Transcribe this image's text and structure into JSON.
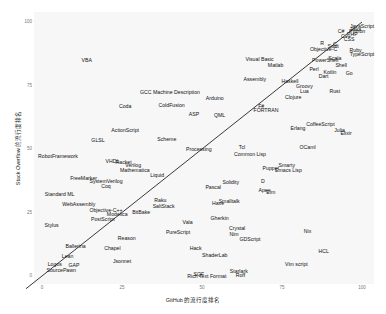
{
  "chart_data": {
    "type": "scatter",
    "title": "",
    "xlabel": "GitHub 的流行度排名",
    "ylabel": "Stack Overflow 的流行度排名",
    "xlim": [
      0,
      100
    ],
    "ylim": [
      0,
      100
    ],
    "xticks": [
      "0",
      "25",
      "50",
      "75",
      "100"
    ],
    "yticks": [
      "0",
      "25",
      "50",
      "75",
      "100"
    ],
    "grid": false,
    "trend_line": {
      "x": [
        -5,
        100
      ],
      "y": [
        -5,
        100
      ]
    },
    "points": [
      {
        "label": "JavaScript",
        "x": 100,
        "y": 98
      },
      {
        "label": "Java",
        "x": 98,
        "y": 97
      },
      {
        "label": "Python",
        "x": 98.5,
        "y": 96
      },
      {
        "label": "PHP",
        "x": 97,
        "y": 95
      },
      {
        "label": "C#",
        "x": 93.5,
        "y": 96
      },
      {
        "label": "C++",
        "x": 95,
        "y": 94
      },
      {
        "label": "CSS",
        "x": 96,
        "y": 93
      },
      {
        "label": "C",
        "x": 91.5,
        "y": 91
      },
      {
        "label": "R",
        "x": 87.5,
        "y": 91.5
      },
      {
        "label": "Objective-C",
        "x": 88,
        "y": 89
      },
      {
        "label": "Swift",
        "x": 91,
        "y": 90
      },
      {
        "label": "Ruby",
        "x": 98,
        "y": 88.5
      },
      {
        "label": "TypeScript",
        "x": 100,
        "y": 87
      },
      {
        "label": "PowerShell",
        "x": 88.5,
        "y": 84.5
      },
      {
        "label": "Scala",
        "x": 91.5,
        "y": 85.5
      },
      {
        "label": "Shell",
        "x": 93.5,
        "y": 82.5
      },
      {
        "label": "Perl",
        "x": 85,
        "y": 81
      },
      {
        "label": "Kotlin",
        "x": 90,
        "y": 80
      },
      {
        "label": "Dart",
        "x": 88,
        "y": 78.5
      },
      {
        "label": "Go",
        "x": 96,
        "y": 79.5
      },
      {
        "label": "Visual Basic",
        "x": 68,
        "y": 85
      },
      {
        "label": "Matlab",
        "x": 73,
        "y": 82.5
      },
      {
        "label": "Haskell",
        "x": 77.5,
        "y": 76.5
      },
      {
        "label": "Assembly",
        "x": 66.5,
        "y": 77
      },
      {
        "label": "Groovy",
        "x": 82,
        "y": 74.5
      },
      {
        "label": "Lua",
        "x": 82,
        "y": 72.5
      },
      {
        "label": "Rust",
        "x": 91.5,
        "y": 72.5
      },
      {
        "label": "Clojure",
        "x": 78.5,
        "y": 70
      },
      {
        "label": "F#",
        "x": 68.5,
        "y": 66.5
      },
      {
        "label": "FORTRAN",
        "x": 70,
        "y": 65
      },
      {
        "label": "CoffeeScript",
        "x": 87,
        "y": 59.5
      },
      {
        "label": "Erlang",
        "x": 80,
        "y": 58
      },
      {
        "label": "Julia",
        "x": 93,
        "y": 57
      },
      {
        "label": "Elixir",
        "x": 95,
        "y": 56
      },
      {
        "label": "OCaml",
        "x": 83,
        "y": 50.5
      },
      {
        "label": "VBA",
        "x": 14,
        "y": 84.5
      },
      {
        "label": "GCC Machine Description",
        "x": 40,
        "y": 72
      },
      {
        "label": "Arduino",
        "x": 54,
        "y": 69.5
      },
      {
        "label": "Coda",
        "x": 26,
        "y": 66.5
      },
      {
        "label": "ColdFusion",
        "x": 40.5,
        "y": 67
      },
      {
        "label": "ASP",
        "x": 47.5,
        "y": 63.5
      },
      {
        "label": "QML",
        "x": 55.5,
        "y": 63
      },
      {
        "label": "ActionScript",
        "x": 26,
        "y": 57
      },
      {
        "label": "Scheme",
        "x": 39,
        "y": 53.5
      },
      {
        "label": "GLSL",
        "x": 17.5,
        "y": 53
      },
      {
        "label": "Tcl",
        "x": 62.5,
        "y": 50.5
      },
      {
        "label": "Common Lisp",
        "x": 65,
        "y": 47.5
      },
      {
        "label": "Processing",
        "x": 49,
        "y": 49.5
      },
      {
        "label": "RobotFramework",
        "x": 5,
        "y": 47
      },
      {
        "label": "VHDL",
        "x": 22,
        "y": 45
      },
      {
        "label": "Racket",
        "x": 25.5,
        "y": 44.5
      },
      {
        "label": "Verilog",
        "x": 28.5,
        "y": 43.5
      },
      {
        "label": "Mathematica",
        "x": 29,
        "y": 41.5
      },
      {
        "label": "Liquid",
        "x": 36,
        "y": 39.5
      },
      {
        "label": "FreeMarker",
        "x": 13,
        "y": 38
      },
      {
        "label": "SystemVerilog",
        "x": 20,
        "y": 37
      },
      {
        "label": "Coq",
        "x": 20,
        "y": 35
      },
      {
        "label": "Standard ML",
        "x": 5.5,
        "y": 32
      },
      {
        "label": "WebAssembly",
        "x": 11.5,
        "y": 28
      },
      {
        "label": "Smarty",
        "x": 76.5,
        "y": 43.5
      },
      {
        "label": "Puppet",
        "x": 71.5,
        "y": 42
      },
      {
        "label": "Emacs Lisp",
        "x": 77,
        "y": 41.5
      },
      {
        "label": "D",
        "x": 69,
        "y": 37
      },
      {
        "label": "Solidity",
        "x": 59,
        "y": 36.5
      },
      {
        "label": "Pascal",
        "x": 53.5,
        "y": 34.5
      },
      {
        "label": "Apex",
        "x": 69.5,
        "y": 33.5
      },
      {
        "label": "Elm",
        "x": 71.5,
        "y": 32.5
      },
      {
        "label": "Smalltalk",
        "x": 58.5,
        "y": 29
      },
      {
        "label": "Haxe",
        "x": 55,
        "y": 28.5
      },
      {
        "label": "Raku",
        "x": 37,
        "y": 29.5
      },
      {
        "label": "SaltStack",
        "x": 38,
        "y": 27
      },
      {
        "label": "BitBake",
        "x": 31,
        "y": 25
      },
      {
        "label": "Objective-C++",
        "x": 20,
        "y": 25.5
      },
      {
        "label": "Modelica",
        "x": 23.5,
        "y": 24
      },
      {
        "label": "PostScript",
        "x": 19,
        "y": 22
      },
      {
        "label": "Gherkin",
        "x": 55.5,
        "y": 22.5
      },
      {
        "label": "Vala",
        "x": 45.5,
        "y": 21
      },
      {
        "label": "PureScript",
        "x": 42.5,
        "y": 17
      },
      {
        "label": "Crystal",
        "x": 61,
        "y": 18.5
      },
      {
        "label": "Nim",
        "x": 60,
        "y": 16
      },
      {
        "label": "GDScript",
        "x": 65,
        "y": 14
      },
      {
        "label": "Nix",
        "x": 83,
        "y": 17.5
      },
      {
        "label": "Stylus",
        "x": 3,
        "y": 19.5
      },
      {
        "label": "Reason",
        "x": 26.5,
        "y": 14.5
      },
      {
        "label": "Ballerina",
        "x": 10.5,
        "y": 11.5
      },
      {
        "label": "Chapel",
        "x": 22,
        "y": 10.5
      },
      {
        "label": "Hack",
        "x": 48,
        "y": 10.5
      },
      {
        "label": "ShaderLab",
        "x": 54,
        "y": 8
      },
      {
        "label": "HCL",
        "x": 88,
        "y": 9.5
      },
      {
        "label": "Lean",
        "x": 8,
        "y": 7.5
      },
      {
        "label": "Jsonnet",
        "x": 25,
        "y": 5.5
      },
      {
        "label": "Logos",
        "x": 4,
        "y": 4.5
      },
      {
        "label": "GAP",
        "x": 10,
        "y": 4
      },
      {
        "label": "SourcePawn",
        "x": 6,
        "y": 2
      },
      {
        "label": "Vim script",
        "x": 79.5,
        "y": 4.5
      },
      {
        "label": "Starlark",
        "x": 61.5,
        "y": 1.5
      },
      {
        "label": "Roff",
        "x": 62,
        "y": 0
      },
      {
        "label": "SQF",
        "x": 49,
        "y": 0.5
      },
      {
        "label": "Rich Text Format",
        "x": 51.5,
        "y": -0.5
      }
    ]
  }
}
